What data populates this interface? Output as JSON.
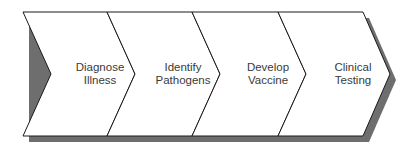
{
  "diagram": {
    "type": "chevron-process",
    "steps": [
      {
        "line1": "Diagnose",
        "line2": "Illness"
      },
      {
        "line1": "Identify",
        "line2": "Pathogens"
      },
      {
        "line1": "Develop",
        "line2": "Vaccine"
      },
      {
        "line1": "Clinical",
        "line2": "Testing"
      }
    ],
    "colors": {
      "fill": "#ffffff",
      "stroke": "#1a1a1a",
      "shadow": "#6e6e6e"
    }
  }
}
